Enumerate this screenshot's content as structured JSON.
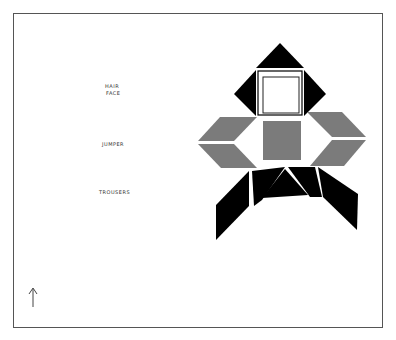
{
  "labels": {
    "hair": "HAIR",
    "face": "FACE",
    "jumper": "JUMPER",
    "trousers": "TROUSERS"
  },
  "icons": {
    "arrow": "up-arrow-icon"
  },
  "colors": {
    "black": "#000000",
    "grey": "#7b7b7b",
    "white": "#ffffff",
    "frame": "#555555"
  }
}
